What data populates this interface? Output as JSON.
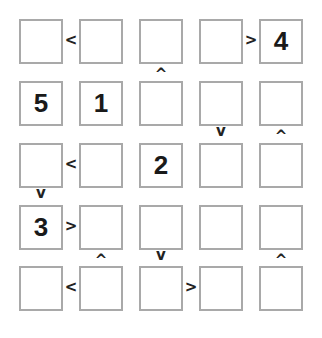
{
  "puzzle": {
    "type": "futoshiki",
    "size": 5,
    "grid": [
      [
        "",
        "",
        "",
        "",
        "4"
      ],
      [
        "5",
        "1",
        "",
        "",
        ""
      ],
      [
        "",
        "",
        "2",
        "",
        ""
      ],
      [
        "3",
        "",
        "",
        "",
        ""
      ],
      [
        "",
        "",
        "",
        "",
        ""
      ]
    ],
    "horizontal_signs": [
      {
        "row": 0,
        "col": 0,
        "symbol": "<"
      },
      {
        "row": 0,
        "col": 3,
        "symbol": ">"
      },
      {
        "row": 2,
        "col": 0,
        "symbol": "<"
      },
      {
        "row": 3,
        "col": 0,
        "symbol": ">"
      },
      {
        "row": 4,
        "col": 0,
        "symbol": "<"
      },
      {
        "row": 4,
        "col": 2,
        "symbol": ">"
      }
    ],
    "vertical_signs": [
      {
        "row": 0,
        "col": 2,
        "symbol": "^"
      },
      {
        "row": 1,
        "col": 3,
        "symbol": "v"
      },
      {
        "row": 1,
        "col": 4,
        "symbol": "^"
      },
      {
        "row": 2,
        "col": 0,
        "symbol": "v"
      },
      {
        "row": 3,
        "col": 1,
        "symbol": "^"
      },
      {
        "row": 3,
        "col": 2,
        "symbol": "v"
      },
      {
        "row": 3,
        "col": 4,
        "symbol": "^"
      }
    ]
  }
}
